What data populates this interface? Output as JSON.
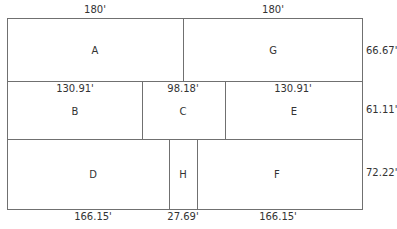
{
  "diagram": {
    "type": "plot-subdivision",
    "regions": [
      {
        "id": "A",
        "label": "A"
      },
      {
        "id": "G",
        "label": "G"
      },
      {
        "id": "B",
        "label": "B"
      },
      {
        "id": "C",
        "label": "C"
      },
      {
        "id": "E",
        "label": "E"
      },
      {
        "id": "D",
        "label": "D"
      },
      {
        "id": "H",
        "label": "H"
      },
      {
        "id": "F",
        "label": "F"
      }
    ],
    "dimensions": {
      "top_left": "180'",
      "top_right": "180'",
      "row2_b": "130.91'",
      "row2_c": "98.18'",
      "row2_e": "130.91'",
      "bottom_d": "166.15'",
      "bottom_h": "27.69'",
      "bottom_f": "166.15'",
      "right_row1": "66.67'",
      "right_row2": "61.11'",
      "right_row3": "72.22'"
    }
  }
}
